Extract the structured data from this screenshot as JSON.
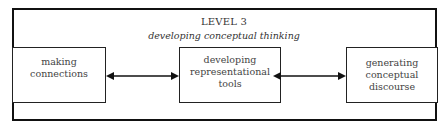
{
  "diagram": {
    "title": "LEVEL 3",
    "subtitle": "developing conceptual thinking",
    "nodes": [
      {
        "id": "making-connections",
        "label": "making\nconnections"
      },
      {
        "id": "developing-representational-tools",
        "label": "developing\nrepresentational\ntools"
      },
      {
        "id": "generating-conceptual-discourse",
        "label": "generating\nconceptual\ndiscourse"
      }
    ],
    "edges": [
      {
        "from": "making-connections",
        "to": "developing-representational-tools",
        "type": "bidirectional"
      },
      {
        "from": "developing-representational-tools",
        "to": "generating-conceptual-discourse",
        "type": "bidirectional"
      }
    ],
    "colors": {
      "stroke": "#111111",
      "text": "#333333",
      "background": "#ffffff"
    }
  }
}
